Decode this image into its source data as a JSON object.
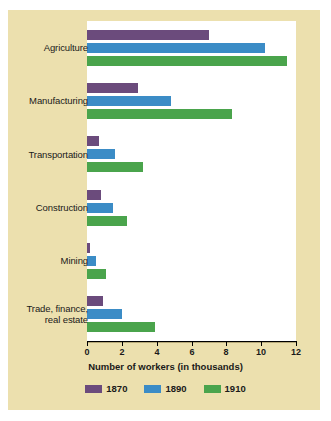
{
  "chart_data": {
    "type": "bar",
    "orientation": "horizontal",
    "title": "",
    "xlabel": "Number of workers (in thousands)",
    "ylabel": "",
    "xlim": [
      0,
      12
    ],
    "xticks": [
      "0",
      "2",
      "4",
      "6",
      "8",
      "10",
      "12"
    ],
    "grid": false,
    "legend_position": "bottom",
    "categories": [
      "Agriculture",
      "Manufacturing",
      "Transportation",
      "Construction",
      "Mining",
      "Trade, finance,\nreal estate"
    ],
    "category_labels": [
      [
        "Agriculture"
      ],
      [
        "Manufacturing"
      ],
      [
        "Transportation"
      ],
      [
        "Construction"
      ],
      [
        "Mining"
      ],
      [
        "Trade, finance,",
        "real estate"
      ]
    ],
    "series": [
      {
        "name": "1870",
        "color": "#6b4b7c",
        "values": [
          7.0,
          2.9,
          0.7,
          0.8,
          0.2,
          0.9
        ]
      },
      {
        "name": "1890",
        "color": "#3b8cc6",
        "values": [
          10.2,
          4.8,
          1.6,
          1.5,
          0.5,
          2.0
        ]
      },
      {
        "name": "1910",
        "color": "#4aa44c",
        "values": [
          11.5,
          8.3,
          3.2,
          2.3,
          1.1,
          3.9
        ]
      }
    ]
  },
  "legend": {
    "items": [
      {
        "label": "1870",
        "color": "#6b4b7c"
      },
      {
        "label": "1890",
        "color": "#3b8cc6"
      },
      {
        "label": "1910",
        "color": "#4aa44c"
      }
    ]
  },
  "colors": {
    "card_background": "#ece0ae",
    "plot_background": "#ffffff",
    "page_background": "#ffffff",
    "axis": "#000000",
    "text": "#1a1a1a"
  }
}
